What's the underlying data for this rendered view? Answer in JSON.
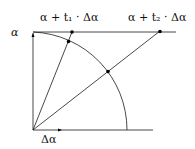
{
  "labels": {
    "alpha": "α",
    "delta_alpha": "Δα",
    "t1_label": "α + t₁ · Δα",
    "t2_label": "α + t₂ · Δα"
  },
  "geometry": {
    "origin": [
      33,
      130
    ],
    "top_y": 32,
    "radius": 94
  },
  "colors": {
    "stroke": "#1a1a1a",
    "background": "#ffffff"
  }
}
